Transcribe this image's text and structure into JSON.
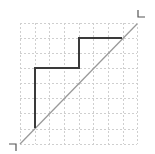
{
  "diagram": {
    "type": "staircase-path-on-grid",
    "grid": {
      "columns": 8,
      "rows": 8,
      "x_lines": [
        20,
        35,
        49,
        64,
        79,
        93,
        108,
        123,
        137
      ],
      "y_lines": [
        23,
        38,
        53,
        68,
        83,
        98,
        113,
        129,
        144
      ],
      "color": "#cfcfcf",
      "dashed": true
    },
    "diagonal": {
      "from": [
        20,
        144
      ],
      "to": [
        137,
        24
      ],
      "color": "#9a9a9a"
    },
    "path": {
      "points": [
        [
          35,
          128
        ],
        [
          35,
          68
        ],
        [
          79,
          68
        ],
        [
          79,
          38
        ],
        [
          122,
          38
        ]
      ],
      "color": "#3a3a3a"
    },
    "markers": {
      "end": {
        "points": [
          [
            138,
            10
          ],
          [
            138,
            17
          ],
          [
            145,
            17
          ]
        ],
        "color": "#555555"
      },
      "start": {
        "points": [
          [
            9,
            144
          ],
          [
            16,
            144
          ],
          [
            16,
            151
          ]
        ],
        "color": "#555555"
      }
    }
  }
}
